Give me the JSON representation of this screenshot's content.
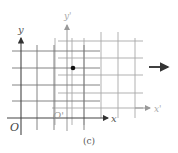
{
  "figure": {
    "caption": "(c)",
    "original_frame": {
      "axis_x_label": "x",
      "axis_y_label": "y",
      "origin_label": "O",
      "color": "#555555"
    },
    "moving_frame": {
      "axis_x_label": "x'",
      "axis_y_label": "y'",
      "origin_label": "O'",
      "color": "#9a9a9a"
    },
    "point": {
      "color": "#111111"
    },
    "motion_arrow": {
      "direction": "right",
      "color": "#111111"
    }
  }
}
